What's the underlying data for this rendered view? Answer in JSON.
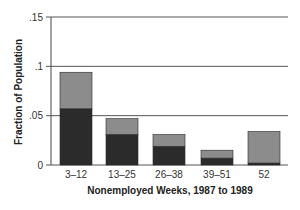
{
  "chart_data": {
    "type": "bar",
    "stacked": true,
    "title": "",
    "xlabel": "Nonemployed Weeks, 1987 to 1989",
    "ylabel": "Fraction of Population",
    "categories": [
      "3–12",
      "13–25",
      "26–38",
      "39–51",
      "52"
    ],
    "series": [
      {
        "name": "lower (dark)",
        "color": "#2b2b2b",
        "values": [
          0.057,
          0.031,
          0.019,
          0.007,
          0.002
        ]
      },
      {
        "name": "upper (light)",
        "color": "#8c8c8c",
        "values": [
          0.037,
          0.016,
          0.012,
          0.008,
          0.032
        ]
      }
    ],
    "totals": [
      0.094,
      0.047,
      0.031,
      0.015,
      0.034
    ],
    "ylim": [
      0,
      0.15
    ],
    "yticks": [
      0,
      0.05,
      0.1,
      0.15
    ],
    "ytick_labels": [
      "0",
      ".05",
      ".1",
      ".15"
    ],
    "grid": true,
    "legend": null
  }
}
